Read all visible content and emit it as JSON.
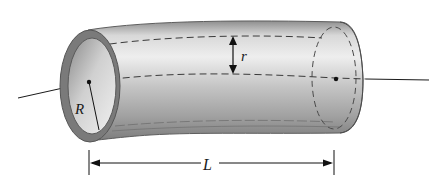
{
  "diagram": {
    "type": "curved-hollow-cylinder",
    "labels": {
      "outer_radius": "R",
      "inner_radius": "r",
      "length": "L"
    },
    "colors": {
      "tube_dark": "#7a7a7a",
      "tube_mid": "#a8a8a8",
      "tube_light": "#e2e2e2",
      "rim": "#6e6e6e",
      "line": "#1a1a1a",
      "dash": "#3a3a3a",
      "background": "#ffffff"
    }
  }
}
